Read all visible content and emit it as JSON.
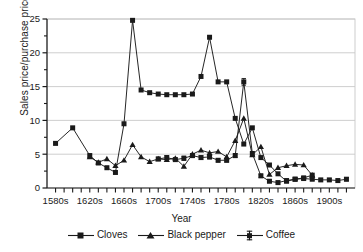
{
  "chart_data": {
    "type": "line",
    "title": "",
    "xlabel": "Year",
    "ylabel": "Sales price/purchase price",
    "xtick_labels": [
      "1580s",
      "1620s",
      "1660s",
      "1700s",
      "1740s",
      "1780s",
      "1820s",
      "1860s",
      "1900s"
    ],
    "xtick_values": [
      1580,
      1620,
      1660,
      1700,
      1740,
      1780,
      1820,
      1860,
      1900
    ],
    "ytick_labels": [
      "0",
      "5",
      "10",
      "15",
      "20",
      "25"
    ],
    "ytick_values": [
      0,
      5,
      10,
      15,
      20,
      25
    ],
    "ylim": [
      0,
      25
    ],
    "xlim": [
      1570,
      1930
    ],
    "grid": "horizontal",
    "legend_position": "bottom",
    "minor_xticks": true,
    "series": [
      {
        "name": "Cloves",
        "marker": "filled-square",
        "x": [
          1580,
          1600,
          1620,
          1630,
          1640,
          1650,
          1660,
          1670,
          1680,
          1690,
          1700,
          1710,
          1720,
          1730,
          1740,
          1750,
          1760,
          1770,
          1780,
          1790,
          1800,
          1810,
          1820,
          1830,
          1840,
          1850,
          1860,
          1870,
          1880
        ],
        "y": [
          6.6,
          8.9,
          4.8,
          3.7,
          3.0,
          2.3,
          9.5,
          24.8,
          14.5,
          14.1,
          13.9,
          13.8,
          13.8,
          13.8,
          13.9,
          16.5,
          22.3,
          15.7,
          15.7,
          10.3,
          6.5,
          8.9,
          4.5,
          3.4,
          2.1,
          1.0,
          1.3,
          1.5,
          1.9
        ]
      },
      {
        "name": "Black pepper",
        "marker": "filled-triangle",
        "x": [
          1620,
          1630,
          1640,
          1650,
          1660,
          1670,
          1680,
          1690,
          1700,
          1710,
          1720,
          1730,
          1740,
          1750,
          1760,
          1770,
          1780,
          1790,
          1800,
          1810,
          1820,
          1830,
          1840,
          1850,
          1860,
          1870,
          1880
        ],
        "y": [
          4.6,
          3.8,
          4.3,
          3.3,
          4.1,
          6.4,
          4.6,
          3.9,
          4.3,
          4.2,
          4.4,
          3.2,
          5.0,
          5.6,
          5.2,
          5.4,
          4.6,
          7.0,
          10.3,
          4.9,
          6.1,
          2.0,
          3.0,
          3.3,
          3.5,
          3.4,
          1.9
        ]
      },
      {
        "name": "Coffee",
        "marker": "square-with-error-bars",
        "x": [
          1700,
          1710,
          1720,
          1730,
          1740,
          1750,
          1760,
          1770,
          1780,
          1790,
          1800,
          1810,
          1820,
          1830,
          1840,
          1850,
          1860,
          1870,
          1880,
          1890,
          1900,
          1910,
          1920
        ],
        "y": [
          4.3,
          4.5,
          4.2,
          4.4,
          4.8,
          4.5,
          4.6,
          4.1,
          4.1,
          4.8,
          15.7,
          5.1,
          1.8,
          1.0,
          0.8,
          1.1,
          1.3,
          1.4,
          1.3,
          1.2,
          1.2,
          1.1,
          1.3
        ],
        "yerr": [
          0.25,
          0.3,
          0.25,
          0.3,
          0.3,
          0.25,
          0.3,
          0.25,
          0.25,
          0.3,
          0.5,
          0.3,
          0.25,
          0.2,
          0.2,
          0.2,
          0.2,
          0.2,
          0.2,
          0.2,
          0.2,
          0.2,
          0.25
        ]
      }
    ]
  },
  "legend": {
    "items": [
      {
        "label": "Cloves",
        "marker": "filled-square"
      },
      {
        "label": "Black pepper",
        "marker": "filled-triangle"
      },
      {
        "label": "Coffee",
        "marker": "square-with-error-bars"
      }
    ]
  },
  "colors": {
    "line": "#1a1a1a",
    "grid": "#c8c8c8",
    "axis": "#1a1a1a",
    "background": "#ffffff"
  }
}
